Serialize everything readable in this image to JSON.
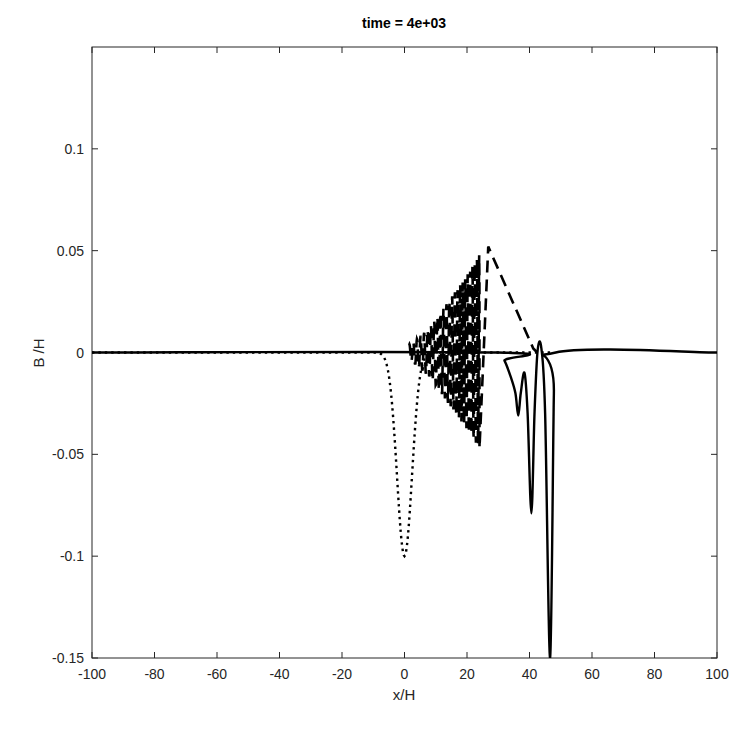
{
  "chart_data": {
    "type": "line",
    "title": "time = 4e+03",
    "xlabel": "x/H",
    "ylabel": "B /H",
    "xlim": [
      -100,
      100
    ],
    "ylim": [
      -0.15,
      0.15
    ],
    "xticks": [
      -100,
      -80,
      -60,
      -40,
      -20,
      0,
      20,
      40,
      60,
      80,
      100
    ],
    "xtick_labels": [
      "-100",
      "-80",
      "-60",
      "-40",
      "-20",
      "0",
      "20",
      "40",
      "60",
      "80",
      "100"
    ],
    "yticks": [
      -0.15,
      -0.1,
      -0.05,
      0,
      0.05,
      0.1
    ],
    "ytick_labels": [
      "-0.15",
      "-0.1",
      "-0.05",
      "0",
      "0.05",
      "0.1"
    ],
    "grid": false,
    "legend": null,
    "series": [
      {
        "name": "initial (dotted)",
        "style": "dotted",
        "description": "Gaussian depression centered at x=0, min -0.1, then flat at 0",
        "points": [
          [
            -100,
            0
          ],
          [
            -8,
            0
          ],
          [
            -6,
            -0.005
          ],
          [
            -4,
            -0.03
          ],
          [
            -2,
            -0.073
          ],
          [
            0,
            -0.1
          ],
          [
            2,
            -0.073
          ],
          [
            4,
            -0.03
          ],
          [
            6,
            -0.005
          ],
          [
            8,
            0
          ],
          [
            47,
            0
          ]
        ]
      },
      {
        "name": "dispersive wave (dashed)",
        "style": "dashed",
        "description": "Oscillatory wave train with growing envelope from x≈2 to x≈24, peak ≈0.052 at x≈26.8, then linear decay to ≈0 at x≈41",
        "envelope": [
          [
            2,
            0.004
          ],
          [
            8,
            0.012
          ],
          [
            14,
            0.025
          ],
          [
            20,
            0.038
          ],
          [
            24,
            0.048
          ]
        ],
        "points": [
          [
            24,
            -0.047
          ],
          [
            26.8,
            0.052
          ],
          [
            41.2,
            0.002
          ],
          [
            42.5,
            0.0
          ]
        ]
      },
      {
        "name": "solution (solid)",
        "style": "solid",
        "description": "Flat at 0, small shelf then three narrow troughs of increasing depth",
        "points": [
          [
            -100,
            0
          ],
          [
            30,
            0
          ],
          [
            32,
            -0.004
          ],
          [
            34,
            -0.012
          ],
          [
            35.5,
            -0.02
          ],
          [
            36.4,
            -0.031
          ],
          [
            37.2,
            -0.02
          ],
          [
            38.4,
            -0.01
          ],
          [
            39.4,
            -0.03
          ],
          [
            40.6,
            -0.079
          ],
          [
            41.6,
            -0.03
          ],
          [
            42.6,
            0.001
          ],
          [
            43.8,
            0.002
          ],
          [
            45,
            -0.03
          ],
          [
            46.6,
            -0.15
          ],
          [
            47.8,
            -0.02
          ],
          [
            48.4,
            0.0
          ],
          [
            100,
            0
          ]
        ]
      }
    ]
  }
}
